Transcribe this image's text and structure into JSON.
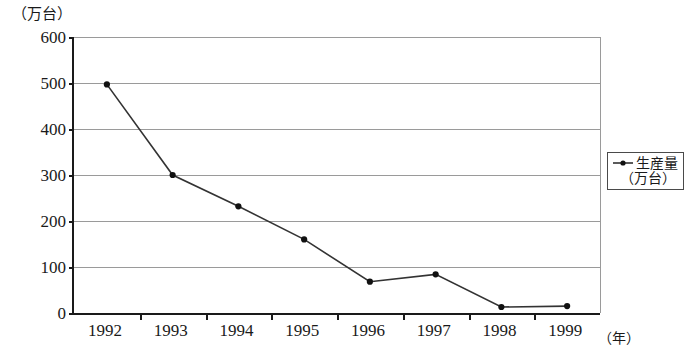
{
  "chart_data": {
    "type": "line",
    "title": "",
    "xlabel": "（年）",
    "ylabel": "（万台）",
    "categories": [
      "1992",
      "1993",
      "1994",
      "1995",
      "1996",
      "1997",
      "1998",
      "1999"
    ],
    "values": [
      497,
      300,
      232,
      160,
      68,
      84,
      13,
      15
    ],
    "series": [
      {
        "name": "生産量（万台）",
        "values": [
          497,
          300,
          232,
          160,
          68,
          84,
          13,
          15
        ]
      }
    ],
    "ylim": [
      0,
      600
    ],
    "y_ticks": [
      0,
      100,
      200,
      300,
      400,
      500,
      600
    ],
    "y_tick_labels": [
      "0",
      "100",
      "200",
      "300",
      "400",
      "500",
      "600"
    ],
    "grid": true,
    "legend_position": "right",
    "line_color": "#333333",
    "marker_color": "#111111",
    "grid_color": "#9a9a9a",
    "axis_color": "#1a1a1a"
  },
  "legend": {
    "series_label": "生産量",
    "unit_label": "（万台）",
    "marker_icon": "line-with-dot-marker"
  },
  "axes": {
    "y_unit_caption": "（万台）",
    "x_unit_caption": "（年）"
  }
}
